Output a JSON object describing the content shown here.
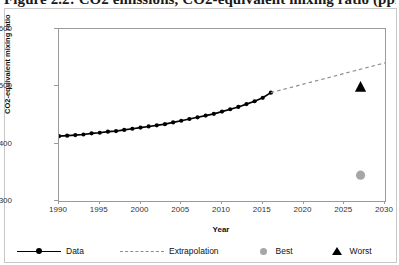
{
  "document": {
    "title": "Figure 2.2: CO2 emissions, CO2-equivalent mixing ratio (ppm)"
  },
  "chart_data": {
    "type": "line",
    "title": "",
    "xlabel": "Year",
    "ylabel": "CO2-equivalent mixing ratio",
    "xlim": [
      1990,
      2030
    ],
    "ylim": [
      300,
      600
    ],
    "xticks": [
      1990,
      1995,
      2000,
      2005,
      2010,
      2015,
      2020,
      2025,
      2030
    ],
    "yticks": [
      300,
      400,
      500,
      600
    ],
    "grid": false,
    "legend_position": "bottom",
    "series": [
      {
        "name": "Data",
        "type": "line-marker",
        "color": "#000000",
        "marker": "circle",
        "x": [
          1990,
          1991,
          1992,
          1993,
          1994,
          1995,
          1996,
          1997,
          1998,
          1999,
          2000,
          2001,
          2002,
          2003,
          2004,
          2005,
          2006,
          2007,
          2008,
          2009,
          2010,
          2011,
          2012,
          2013,
          2014,
          2015,
          2016
        ],
        "values": [
          413,
          414,
          415,
          416,
          418,
          419,
          421,
          422,
          424,
          426,
          428,
          430,
          432,
          434,
          437,
          440,
          443,
          446,
          449,
          452,
          456,
          460,
          464,
          469,
          474,
          480,
          489
        ]
      },
      {
        "name": "Extrapolation",
        "type": "line-dashed",
        "color": "#8e8e8e",
        "x": [
          2016,
          2030
        ],
        "values": [
          489,
          541
        ]
      },
      {
        "name": "Best",
        "type": "point",
        "color": "#a6a6a6",
        "marker": "circle",
        "x": [
          2027
        ],
        "values": [
          345
        ]
      },
      {
        "name": "Worst",
        "type": "point",
        "color": "#000000",
        "marker": "triangle",
        "x": [
          2027
        ],
        "values": [
          500
        ]
      }
    ]
  },
  "legend": {
    "items": [
      {
        "label": "Data"
      },
      {
        "label": "Extrapolation"
      },
      {
        "label": "Best"
      },
      {
        "label": "Worst"
      }
    ]
  }
}
